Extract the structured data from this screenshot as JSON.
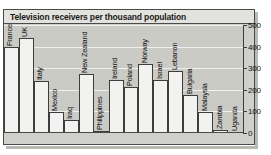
{
  "chart_data": {
    "type": "bar",
    "title": "Television receivers per thousand population",
    "xlabel": "",
    "ylabel": "",
    "ylim": [
      0,
      500
    ],
    "yticks": [
      0,
      100,
      200,
      300,
      400,
      500
    ],
    "grid": true,
    "legend": "none",
    "categories": [
      "France",
      "UK",
      "Italy",
      "Mexico",
      "Iraq",
      "New Zealand",
      "Philippines",
      "Ireland",
      "Poland",
      "Norway",
      "Israel",
      "Lebanon",
      "Bulgaria",
      "Malaysia",
      "Zambia",
      "Uganda"
    ],
    "values": [
      400,
      440,
      240,
      95,
      60,
      275,
      10,
      245,
      215,
      320,
      245,
      285,
      175,
      95,
      12,
      5
    ],
    "bars": [
      {
        "label": "France",
        "value": 400
      },
      {
        "label": "UK",
        "value": 440
      },
      {
        "label": "Italy",
        "value": 240
      },
      {
        "label": "Mexico",
        "value": 95
      },
      {
        "label": "Iraq",
        "value": 60
      },
      {
        "label": "New Zealand",
        "value": 275
      },
      {
        "label": "Philippines",
        "value": 10
      },
      {
        "label": "Ireland",
        "value": 245
      },
      {
        "label": "Poland",
        "value": 215
      },
      {
        "label": "Norway",
        "value": 320
      },
      {
        "label": "Israel",
        "value": 245
      },
      {
        "label": "Lebanon",
        "value": 285
      },
      {
        "label": "Bulgaria",
        "value": 175
      },
      {
        "label": "Malaysia",
        "value": 95
      },
      {
        "label": "Zambia",
        "value": 12
      },
      {
        "label": "Uganda",
        "value": 5
      }
    ]
  },
  "panel": {
    "title": "Television receivers per thousand population"
  },
  "axis": {
    "tick_labels": [
      "500",
      "400",
      "300",
      "200",
      "100",
      "0"
    ]
  },
  "colors": {
    "panel_background": "#cfcfcb",
    "plot_background": "#cbcbc6",
    "bar_fill": "#f2f2f0",
    "bar_stroke": "#3d3d3d",
    "gridline": "#efefee",
    "title_bar": "#e2e2de",
    "text": "#111111"
  }
}
